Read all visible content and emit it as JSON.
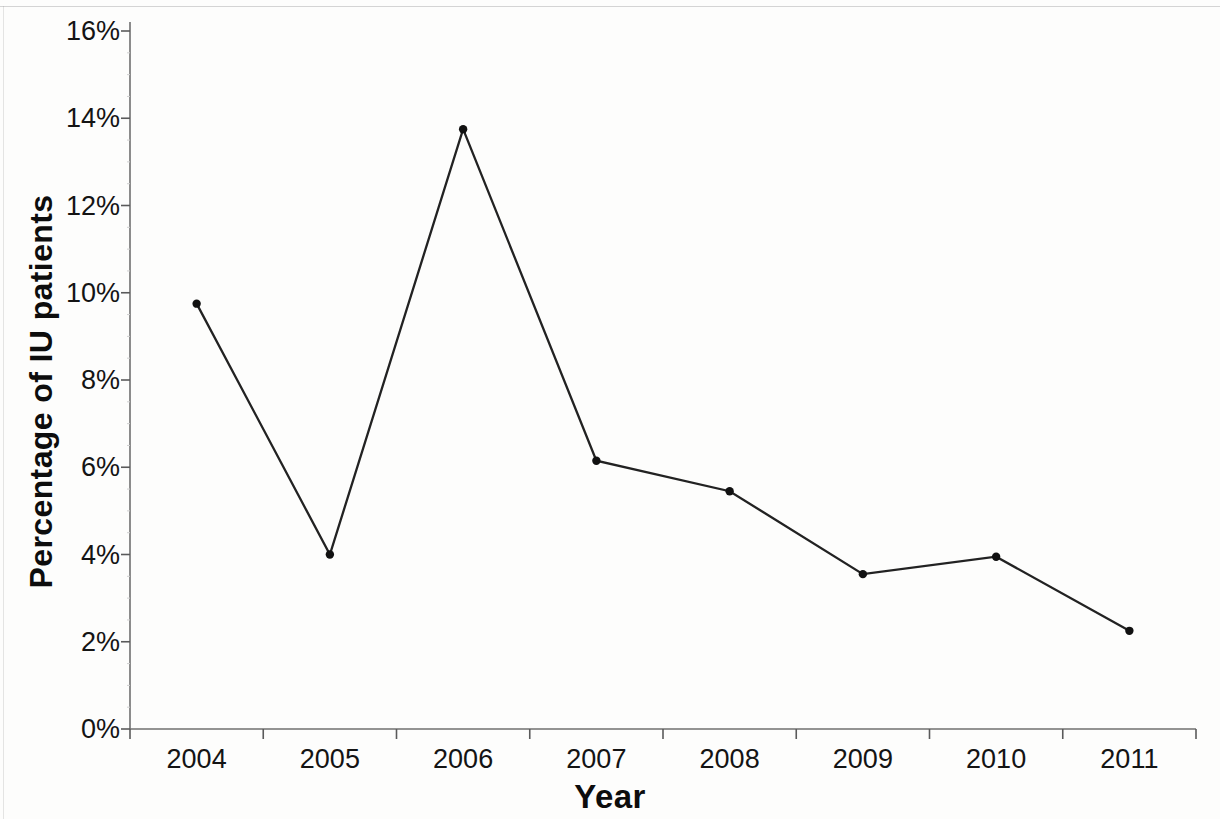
{
  "chart_data": {
    "type": "line",
    "title": "",
    "xlabel": "Year",
    "ylabel": "Percentage of IU patients",
    "categories": [
      "2004",
      "2005",
      "2006",
      "2007",
      "2008",
      "2009",
      "2010",
      "2011"
    ],
    "values": [
      9.75,
      4.0,
      13.75,
      6.15,
      5.45,
      3.55,
      3.95,
      2.25
    ],
    "value_labels": [
      "9.75%",
      "4.0%",
      "13.75%",
      "6.15%",
      "5.45%",
      "3.55%",
      "3.95%",
      "2.25%"
    ],
    "series": [
      {
        "name": "Percentage of IU patients",
        "values": [
          9.75,
          4.0,
          13.75,
          6.15,
          5.45,
          3.55,
          3.95,
          2.25
        ]
      }
    ],
    "ylim": [
      0,
      16
    ],
    "ytick_values": [
      0,
      2,
      4,
      6,
      8,
      10,
      12,
      14,
      16
    ],
    "ytick_labels": [
      "0%",
      "2%",
      "4%",
      "6%",
      "8%",
      "10%",
      "12%",
      "14%",
      "16%"
    ],
    "xtick_labels": [
      "2004",
      "2005",
      "2006",
      "2007",
      "2008",
      "2009",
      "2010",
      "2011"
    ],
    "grid": false,
    "legend": false,
    "legend_position": "none",
    "marker": "filled-circle",
    "line_color": "#222222",
    "marker_color": "#111111",
    "background_color": "#fdfdfc"
  },
  "axes": {
    "y_title": "Percentage of IU patients",
    "x_title": "Year"
  }
}
